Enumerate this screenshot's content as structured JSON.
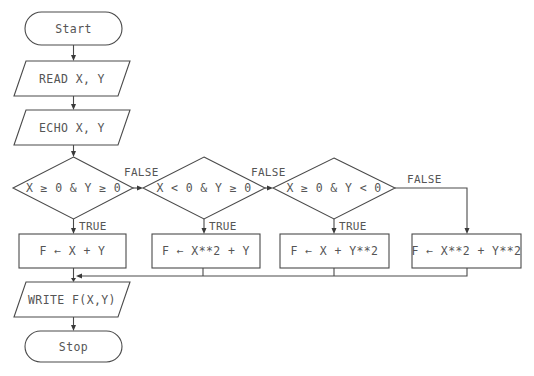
{
  "diagram": {
    "type": "flowchart",
    "nodes": {
      "start": {
        "shape": "terminator",
        "label": "Start"
      },
      "read": {
        "shape": "io",
        "label": "READ X, Y"
      },
      "echo": {
        "shape": "io",
        "label": "ECHO X, Y"
      },
      "cond1": {
        "shape": "decision",
        "label": "X ≥ 0 & Y ≥ 0"
      },
      "cond2": {
        "shape": "decision",
        "label": "X < 0 & Y ≥ 0"
      },
      "cond3": {
        "shape": "decision",
        "label": "X ≥ 0 & Y < 0"
      },
      "proc1": {
        "shape": "process",
        "label": "F ← X + Y"
      },
      "proc2": {
        "shape": "process",
        "label": "F ← X**2 + Y"
      },
      "proc3": {
        "shape": "process",
        "label": "F ← X + Y**2"
      },
      "proc4": {
        "shape": "process",
        "label": "F ← X**2 + Y**2"
      },
      "write": {
        "shape": "io",
        "label": "WRITE F(X,Y)"
      },
      "stop": {
        "shape": "terminator",
        "label": "Stop"
      }
    },
    "edge_labels": {
      "cond1_true": "TRUE",
      "cond1_false": "FALSE",
      "cond2_true": "TRUE",
      "cond2_false": "FALSE",
      "cond3_true": "TRUE",
      "cond3_false": "FALSE"
    },
    "edges": [
      {
        "from": "start",
        "to": "read"
      },
      {
        "from": "read",
        "to": "echo"
      },
      {
        "from": "echo",
        "to": "cond1"
      },
      {
        "from": "cond1",
        "to": "proc1",
        "label": "TRUE"
      },
      {
        "from": "cond1",
        "to": "cond2",
        "label": "FALSE"
      },
      {
        "from": "cond2",
        "to": "proc2",
        "label": "TRUE"
      },
      {
        "from": "cond2",
        "to": "cond3",
        "label": "FALSE"
      },
      {
        "from": "cond3",
        "to": "proc3",
        "label": "TRUE"
      },
      {
        "from": "cond3",
        "to": "proc4",
        "label": "FALSE"
      },
      {
        "from": "proc1",
        "to": "write"
      },
      {
        "from": "proc2",
        "to": "write"
      },
      {
        "from": "proc3",
        "to": "write"
      },
      {
        "from": "proc4",
        "to": "write"
      },
      {
        "from": "write",
        "to": "stop"
      }
    ]
  }
}
